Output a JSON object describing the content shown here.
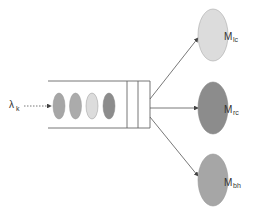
{
  "diagram": {
    "type": "queueing-dispatch",
    "arrival": {
      "symbol": "λ",
      "subscript": "k"
    },
    "queue": {
      "jobs": [
        {
          "color": "#a6a6a6"
        },
        {
          "color": "#ababab"
        },
        {
          "color": "#dcdcdc"
        },
        {
          "color": "#8c8c8c"
        }
      ],
      "slots": 2
    },
    "servers": [
      {
        "name": "M",
        "subscript": "lc",
        "color": "#dcdcdc"
      },
      {
        "name": "M",
        "subscript": "rc",
        "color": "#8c8c8c"
      },
      {
        "name": "M",
        "subscript": "bh",
        "color": "#a6a6a6"
      }
    ],
    "colors": {
      "line": "#555555",
      "ellipse_stroke": "#999999"
    }
  }
}
